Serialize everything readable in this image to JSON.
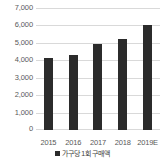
{
  "chart_data": {
    "type": "bar",
    "title": "",
    "subtitle": "",
    "xlabel": "",
    "ylabel": "",
    "categories": [
      "2015",
      "2016",
      "2017",
      "2018",
      "2019E"
    ],
    "values": [
      4150,
      4300,
      4950,
      5200,
      6000
    ],
    "series": [
      {
        "name": "가구당 1회 구매액",
        "values": [
          4150,
          4300,
          4950,
          5200,
          6000
        ]
      }
    ],
    "ylim": [
      0,
      7000
    ],
    "y_ticks": [
      0,
      1000,
      2000,
      3000,
      4000,
      5000,
      6000,
      7000
    ],
    "y_tick_labels": [
      "0",
      "1,000",
      "2,000",
      "3,000",
      "4,000",
      "5,000",
      "6,000",
      "7,000"
    ],
    "x_tick_labels": [
      "2015",
      "2016",
      "2017",
      "2018",
      "2019E"
    ],
    "grid": true,
    "grid_axis": "y",
    "legend_position": "bottom",
    "legend_entries": [
      {
        "label": "가구당 1회 구매액",
        "marker": "square",
        "color": "#2b2b2b"
      }
    ],
    "colors": {
      "bar": "#2b2b2b",
      "gridline": "#d9d9d9",
      "text": "#595959",
      "background": "#ffffff"
    }
  },
  "legend": {
    "marker_icon": "square-marker-icon",
    "label": "가구당 1회 구매액"
  }
}
